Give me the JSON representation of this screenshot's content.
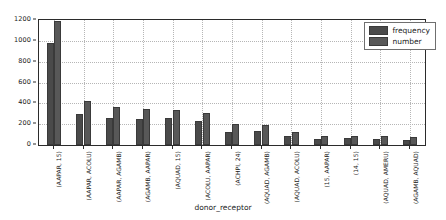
{
  "chart_data": {
    "type": "bar",
    "title": "",
    "xlabel": "donor_receptor",
    "ylabel": "",
    "ylim": [
      0,
      1200
    ],
    "yticks": [
      0,
      200,
      400,
      600,
      800,
      1000,
      1200
    ],
    "ytick_labels": [
      "0",
      "200",
      "400",
      "600",
      "800",
      "1000",
      "1200"
    ],
    "grid": true,
    "legend_position": "upper right",
    "categories": [
      "(AAPAR, 15)",
      "(AAPAR, ACOLU)",
      "(AAPAR, AGAMB)",
      "(AGAMB, AAPAR)",
      "(AQUAD, 15)",
      "(ACOLU, AAPAR)",
      "(ACHPI, 24)",
      "(AQUAD, AGAMB)",
      "(AQUAD, ACOLU)",
      "(15, AAPAR)",
      "(14, 15)",
      "(AQUAD, AMERU)",
      "(AGAMB, AQUAD)"
    ],
    "series": [
      {
        "name": "frequency",
        "color": "#4a4a4a",
        "values": [
          975,
          300,
          255,
          247,
          262,
          228,
          125,
          132,
          90,
          55,
          65,
          55,
          52
        ]
      },
      {
        "name": "number",
        "color": "#585858",
        "values": [
          1190,
          420,
          365,
          345,
          335,
          310,
          197,
          193,
          128,
          88,
          90,
          88,
          80
        ]
      }
    ]
  },
  "legend": {
    "entries": [
      {
        "label": "frequency",
        "color": "#4a4a4a"
      },
      {
        "label": "number",
        "color": "#585858"
      }
    ]
  },
  "axis": {
    "x_title": "donor_receptor"
  }
}
